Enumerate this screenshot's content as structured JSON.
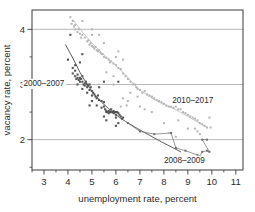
{
  "chart_data": {
    "type": "scatter",
    "title": "",
    "xlabel": "unemployment rate, percent",
    "ylabel": "vacancy rate, percent",
    "xlim": [
      2.5,
      11.3
    ],
    "ylim": [
      1.45,
      4.35
    ],
    "xticks": [
      3,
      4,
      5,
      6,
      7,
      8,
      9,
      10,
      11
    ],
    "xticklabels": [
      "3",
      "4",
      "5",
      "6",
      "7",
      "8",
      "9",
      "10",
      "11"
    ],
    "xminorticks": [
      2.5,
      3.5,
      4.5,
      5.5,
      6.5,
      7.5,
      8.5,
      9.5,
      10.5
    ],
    "yticks": [
      2,
      3,
      4
    ],
    "yticklabels": [
      "2",
      "3",
      "4"
    ],
    "yminorticks": [
      1.5,
      2.5,
      3.5
    ],
    "grid": "horizontal",
    "gridlines_y": [
      2,
      3,
      4
    ],
    "legend": "inline-annotations",
    "annotations": [
      {
        "text": "2000–2007",
        "x": 3.85,
        "y": 3.02,
        "anchor": "end"
      },
      {
        "text": "2010–2017",
        "x": 8.35,
        "y": 2.72,
        "anchor": "start"
      },
      {
        "text": "2008–2009",
        "x": 8.0,
        "y": 1.63,
        "anchor": "start"
      }
    ],
    "series": [
      {
        "name": "2000–2007",
        "color": "#555555",
        "marker": "square",
        "marker_size": 2.1,
        "points": [
          [
            4.0,
            3.45
          ],
          [
            4.1,
            3.9
          ],
          [
            4.2,
            3.3
          ],
          [
            4.2,
            3.2
          ],
          [
            4.3,
            3.25
          ],
          [
            4.3,
            3.15
          ],
          [
            4.35,
            3.1
          ],
          [
            4.4,
            3.12
          ],
          [
            4.4,
            3.18
          ],
          [
            4.45,
            3.08
          ],
          [
            4.5,
            3.12
          ],
          [
            4.5,
            3.05
          ],
          [
            4.55,
            3.1
          ],
          [
            4.6,
            3.15
          ],
          [
            4.6,
            3.05
          ],
          [
            4.65,
            3.0
          ],
          [
            4.7,
            3.02
          ],
          [
            4.7,
            2.98
          ],
          [
            4.75,
            3.05
          ],
          [
            4.8,
            3.0
          ],
          [
            4.8,
            2.95
          ],
          [
            4.85,
            2.98
          ],
          [
            4.9,
            3.0
          ],
          [
            4.9,
            2.9
          ],
          [
            4.95,
            2.95
          ],
          [
            5.0,
            2.88
          ],
          [
            5.0,
            2.8
          ],
          [
            5.05,
            2.85
          ],
          [
            5.1,
            2.82
          ],
          [
            5.15,
            2.78
          ],
          [
            5.2,
            2.75
          ],
          [
            5.25,
            2.8
          ],
          [
            5.3,
            2.72
          ],
          [
            5.3,
            2.95
          ],
          [
            5.4,
            2.7
          ],
          [
            5.5,
            3.05
          ],
          [
            5.5,
            2.68
          ],
          [
            5.5,
            2.6
          ],
          [
            5.55,
            2.55
          ],
          [
            5.6,
            2.5
          ],
          [
            5.6,
            2.52
          ],
          [
            5.65,
            2.5
          ],
          [
            5.7,
            2.48
          ],
          [
            5.7,
            2.52
          ],
          [
            5.75,
            2.5
          ],
          [
            5.8,
            2.5
          ],
          [
            5.8,
            2.55
          ],
          [
            5.85,
            2.5
          ],
          [
            5.9,
            2.48
          ],
          [
            5.9,
            2.52
          ],
          [
            5.95,
            2.5
          ],
          [
            6.0,
            2.5
          ],
          [
            6.0,
            2.45
          ],
          [
            6.0,
            2.4
          ],
          [
            6.05,
            2.5
          ],
          [
            6.1,
            2.48
          ],
          [
            6.1,
            3.05
          ],
          [
            6.15,
            2.45
          ],
          [
            6.2,
            2.42
          ],
          [
            6.25,
            2.38
          ],
          [
            6.3,
            2.4
          ],
          [
            6.0,
            2.25
          ],
          [
            6.1,
            2.3
          ],
          [
            5.6,
            2.35
          ],
          [
            5.5,
            2.42
          ],
          [
            5.4,
            2.58
          ],
          [
            5.2,
            2.62
          ],
          [
            5.0,
            2.7
          ],
          [
            4.8,
            2.85
          ],
          [
            4.6,
            2.92
          ],
          [
            4.4,
            3.0
          ],
          [
            4.3,
            3.35
          ],
          [
            4.5,
            3.4
          ],
          [
            4.6,
            3.55
          ],
          [
            4.9,
            2.62
          ]
        ]
      },
      {
        "name": "2008–2009",
        "color": "#6e6e6e",
        "marker": "square",
        "marker_size": 2.0,
        "connected": true,
        "points": [
          [
            6.5,
            2.3
          ],
          [
            7.0,
            2.15
          ],
          [
            7.6,
            2.1
          ],
          [
            8.3,
            2.12
          ],
          [
            8.5,
            1.85
          ],
          [
            8.9,
            1.8
          ],
          [
            9.4,
            1.72
          ],
          [
            9.5,
            1.7
          ],
          [
            9.6,
            1.78
          ],
          [
            9.8,
            1.8
          ],
          [
            9.9,
            1.78
          ],
          [
            9.6,
            2.0
          ],
          [
            9.8,
            2.0
          ]
        ]
      },
      {
        "name": "2010–2017",
        "color": "#b5b5b5",
        "marker": "square",
        "marker_size": 2.0,
        "points": [
          [
            4.1,
            4.22
          ],
          [
            4.15,
            4.1
          ],
          [
            4.2,
            4.15
          ],
          [
            4.25,
            4.05
          ],
          [
            4.3,
            4.0
          ],
          [
            4.3,
            4.08
          ],
          [
            4.4,
            3.95
          ],
          [
            4.45,
            4.0
          ],
          [
            4.5,
            3.92
          ],
          [
            4.55,
            3.85
          ],
          [
            4.6,
            3.9
          ],
          [
            4.7,
            3.85
          ],
          [
            4.8,
            3.78
          ],
          [
            4.85,
            3.8
          ],
          [
            4.9,
            3.72
          ],
          [
            4.95,
            3.75
          ],
          [
            5.0,
            3.7
          ],
          [
            5.0,
            4.0
          ],
          [
            5.05,
            3.68
          ],
          [
            5.1,
            3.65
          ],
          [
            5.15,
            3.68
          ],
          [
            5.2,
            3.62
          ],
          [
            5.25,
            3.6
          ],
          [
            5.3,
            3.62
          ],
          [
            5.35,
            3.58
          ],
          [
            5.4,
            3.55
          ],
          [
            5.45,
            3.55
          ],
          [
            5.5,
            3.5
          ],
          [
            5.5,
            3.75
          ],
          [
            5.6,
            3.48
          ],
          [
            5.7,
            3.45
          ],
          [
            5.75,
            3.4
          ],
          [
            5.8,
            3.42
          ],
          [
            5.9,
            3.38
          ],
          [
            6.0,
            3.35
          ],
          [
            6.0,
            3.5
          ],
          [
            6.1,
            3.3
          ],
          [
            6.2,
            3.28
          ],
          [
            6.3,
            3.2
          ],
          [
            6.4,
            3.15
          ],
          [
            6.5,
            3.1
          ],
          [
            6.6,
            3.05
          ],
          [
            6.7,
            3.0
          ],
          [
            6.8,
            3.0
          ],
          [
            6.85,
            2.95
          ],
          [
            6.9,
            2.92
          ],
          [
            7.0,
            2.9
          ],
          [
            7.1,
            2.85
          ],
          [
            7.2,
            2.88
          ],
          [
            7.3,
            2.82
          ],
          [
            7.4,
            2.8
          ],
          [
            7.5,
            2.78
          ],
          [
            7.6,
            2.75
          ],
          [
            7.7,
            2.72
          ],
          [
            7.8,
            2.7
          ],
          [
            7.9,
            2.68
          ],
          [
            8.0,
            2.65
          ],
          [
            8.1,
            2.62
          ],
          [
            8.2,
            2.6
          ],
          [
            8.3,
            2.6
          ],
          [
            8.4,
            2.58
          ],
          [
            8.5,
            2.6
          ],
          [
            8.6,
            2.55
          ],
          [
            8.7,
            2.55
          ],
          [
            8.8,
            2.5
          ],
          [
            8.9,
            2.48
          ],
          [
            9.0,
            2.45
          ],
          [
            9.1,
            2.42
          ],
          [
            9.2,
            2.4
          ],
          [
            9.3,
            2.38
          ],
          [
            9.4,
            2.35
          ],
          [
            9.5,
            2.3
          ],
          [
            9.6,
            2.28
          ],
          [
            9.7,
            2.25
          ],
          [
            9.8,
            2.22
          ],
          [
            9.9,
            2.4
          ],
          [
            9.5,
            2.1
          ],
          [
            9.4,
            2.15
          ],
          [
            8.2,
            2.12
          ],
          [
            8.5,
            2.05
          ],
          [
            7.5,
            2.5
          ],
          [
            7.0,
            2.6
          ],
          [
            6.5,
            2.7
          ],
          [
            6.3,
            2.75
          ],
          [
            6.2,
            2.6
          ],
          [
            6.45,
            2.62
          ],
          [
            5.9,
            3.0
          ],
          [
            6.6,
            2.85
          ],
          [
            6.9,
            2.78
          ],
          [
            7.2,
            2.55
          ],
          [
            8.0,
            2.3
          ],
          [
            8.6,
            2.35
          ],
          [
            9.0,
            2.2
          ],
          [
            5.6,
            3.22
          ],
          [
            5.9,
            3.15
          ],
          [
            6.1,
            3.6
          ],
          [
            6.3,
            3.45
          ],
          [
            5.3,
            3.9
          ],
          [
            5.0,
            3.9
          ],
          [
            4.6,
            4.15
          ],
          [
            9.95,
            2.22
          ],
          [
            9.3,
            2.2
          ]
        ]
      }
    ],
    "trend_curves": [
      {
        "name": "2000–2007 fitted curve",
        "color": "#4a4a4a",
        "path": [
          [
            3.9,
            3.72
          ],
          [
            4.2,
            3.48
          ],
          [
            4.5,
            3.22
          ],
          [
            4.8,
            3.0
          ],
          [
            5.1,
            2.82
          ],
          [
            5.4,
            2.68
          ],
          [
            5.7,
            2.56
          ],
          [
            6.0,
            2.45
          ],
          [
            6.4,
            2.33
          ],
          [
            6.9,
            2.2
          ],
          [
            7.4,
            2.08
          ],
          [
            7.9,
            1.96
          ],
          [
            8.35,
            1.86
          ],
          [
            8.7,
            1.78
          ]
        ]
      },
      {
        "name": "2010–2017 fitted curve",
        "color": "#c0c0c0",
        "path": [
          [
            4.2,
            4.18
          ],
          [
            4.6,
            3.95
          ],
          [
            5.0,
            3.75
          ],
          [
            5.4,
            3.58
          ],
          [
            5.8,
            3.42
          ],
          [
            6.2,
            3.26
          ],
          [
            6.6,
            3.08
          ],
          [
            7.0,
            2.9
          ],
          [
            7.4,
            2.78
          ],
          [
            7.8,
            2.68
          ],
          [
            8.2,
            2.6
          ],
          [
            8.6,
            2.52
          ],
          [
            9.0,
            2.42
          ],
          [
            9.4,
            2.32
          ],
          [
            9.8,
            2.22
          ]
        ]
      }
    ]
  }
}
